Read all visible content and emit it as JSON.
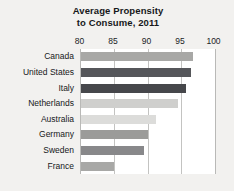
{
  "chart_data": {
    "type": "bar",
    "orientation": "horizontal",
    "title": "Average Propensity to Consume, 2011",
    "title_lines": [
      "Average Propensity",
      "to Consume, 2011"
    ],
    "xlabel": "",
    "ylabel": "",
    "xlim": [
      80,
      100
    ],
    "xticks": [
      80,
      85,
      90,
      95,
      100
    ],
    "xtick_labels": [
      "80",
      "85",
      "90",
      "95",
      "100"
    ],
    "grid": true,
    "gridlines_at": [
      85,
      90,
      95
    ],
    "legend": "none",
    "categories": [
      "Canada",
      "United States",
      "Italy",
      "Netherlands",
      "Australia",
      "Germany",
      "Sweden",
      "France"
    ],
    "values": [
      96.8,
      96.5,
      95.8,
      94.5,
      91.3,
      90.0,
      89.5,
      85.0
    ],
    "bar_colors": [
      "#a8a8a6",
      "#55565a",
      "#46474b",
      "#cfcfcd",
      "#dcdcda",
      "#9b9b99",
      "#88888a",
      "#a8a8a6"
    ],
    "bars": [
      {
        "category": "Canada",
        "value": 96.8,
        "color": "#a8a8a6"
      },
      {
        "category": "United States",
        "value": 96.5,
        "color": "#55565a"
      },
      {
        "category": "Italy",
        "value": 95.8,
        "color": "#46474b"
      },
      {
        "category": "Netherlands",
        "value": 94.5,
        "color": "#cfcfcd"
      },
      {
        "category": "Australia",
        "value": 91.3,
        "color": "#dcdcda"
      },
      {
        "category": "Germany",
        "value": 90.0,
        "color": "#9b9b99"
      },
      {
        "category": "Sweden",
        "value": 89.5,
        "color": "#88888a"
      },
      {
        "category": "France",
        "value": 85.0,
        "color": "#a8a8a6"
      }
    ]
  },
  "style": {
    "figure_background": "#f2f1ef",
    "plot_background": "#ffffff",
    "grid_color": "#c3c3c1",
    "axis_color": "#b9b9b7",
    "text_color": "#16181a"
  }
}
